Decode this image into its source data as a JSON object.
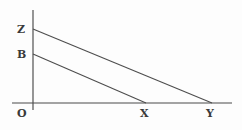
{
  "figure": {
    "type": "geometry-diagram",
    "title": "",
    "background_color": "#fdfdfd",
    "line_color": "#4a4a4a",
    "label_color": "#3a3a3a",
    "width": 242,
    "height": 130
  },
  "axes": {
    "vertical": {
      "name": "y-axis",
      "x": 33,
      "y_top": 10,
      "y_bottom": 110
    },
    "horizontal": {
      "name": "x-axis",
      "y": 103,
      "x_left": 12,
      "x_right": 232
    }
  },
  "points": {
    "O": {
      "label": "O",
      "x": 33,
      "y": 103,
      "on": "origin"
    },
    "Z": {
      "label": "Z",
      "x": 33,
      "y": 29,
      "on": "y-axis"
    },
    "B": {
      "label": "B",
      "x": 33,
      "y": 54,
      "on": "y-axis"
    },
    "X": {
      "label": "X",
      "x": 146,
      "y": 103,
      "on": "x-axis"
    },
    "Y": {
      "label": "Y",
      "x": 212,
      "y": 103,
      "on": "x-axis"
    }
  },
  "segments": [
    {
      "name": "segment-ZY",
      "from": "Z",
      "to": "Y",
      "x1": 33,
      "y1": 29,
      "x2": 212,
      "y2": 103
    },
    {
      "name": "segment-BX",
      "from": "B",
      "to": "X",
      "x1": 33,
      "y1": 54,
      "x2": 146,
      "y2": 103
    }
  ],
  "labels": {
    "Z": "Z",
    "B": "B",
    "O": "O",
    "X": "X",
    "Y": "Y"
  }
}
